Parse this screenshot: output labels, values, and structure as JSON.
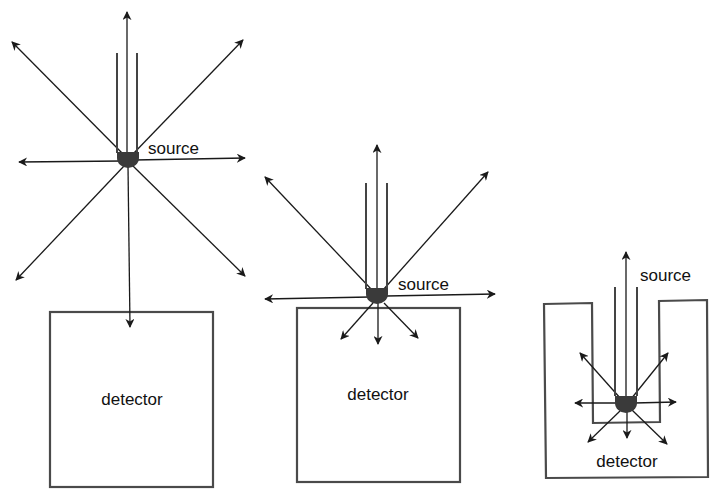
{
  "diagram": {
    "panels": [
      {
        "id": "far",
        "source_label": "source",
        "detector_label": "detector",
        "geometry": "source far above detector"
      },
      {
        "id": "near",
        "source_label": "source",
        "detector_label": "detector",
        "geometry": "source on top of detector surface"
      },
      {
        "id": "well",
        "source_label": "source",
        "detector_label": "detector",
        "geometry": "source inside well detector"
      }
    ]
  },
  "colors": {
    "line": "#1a1a1a",
    "box": "#4a4a4a",
    "source": "#3a3a3a",
    "background": "#ffffff"
  }
}
